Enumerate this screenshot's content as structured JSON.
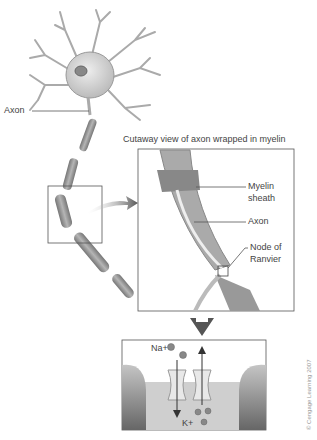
{
  "figure": {
    "labels": {
      "axon_main": "Axon",
      "cutaway_title": "Cutaway view of axon wrapped in myelin",
      "myelin_line1": "Myelin",
      "myelin_line2": "sheath",
      "axon_cutaway": "Axon",
      "node_line1": "Node of",
      "node_line2": "Ranvier",
      "sodium": "Na+",
      "potassium": "K+"
    },
    "credit": "© Cengage Learning 2007",
    "colors": {
      "line": "#555555",
      "cell": "#d8d8d8",
      "myelin": "#9a9a9a",
      "membrane_dark": "#7a7a7a",
      "fluid": "#c8c8c8"
    }
  }
}
